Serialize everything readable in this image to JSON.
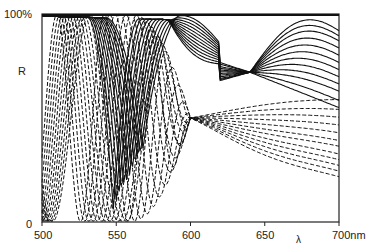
{
  "chart_data": {
    "type": "line",
    "title": "",
    "xlabel": "λ",
    "ylabel": "R",
    "xlim": [
      500,
      700
    ],
    "ylim": [
      0,
      100
    ],
    "x_ticks": [
      500,
      550,
      600,
      650,
      700
    ],
    "x_tick_labels": [
      "500",
      "550",
      "600",
      "650",
      "700nm"
    ],
    "y_tick_labels": [
      "0",
      "100%"
    ],
    "grid": false,
    "legend": null,
    "annotations": [
      {
        "text": "solid curves cross near",
        "x": 640,
        "y": 72
      },
      {
        "text": "dashed/solid curves converge near",
        "x": 600,
        "y": 50
      }
    ],
    "series_groups": [
      {
        "name": "solid",
        "style": "solid",
        "count": 12,
        "description": "High-reflectance curves near 100% at short wavelengths, with minima shifting from ~555nm to ~700nm; all pass through ~72% at ~640nm",
        "end_values_at_700": [
          87,
          85,
          83,
          80,
          77,
          74,
          71,
          68,
          65,
          62,
          58,
          55
        ]
      },
      {
        "name": "dashed",
        "style": "dashed",
        "count": 12,
        "description": "Oscillating curves with deep minima (near 0%) between 520–580nm, converging through ~50% at ~600nm, then broad maxima ~45–55% and falling to 25–54% at 700nm",
        "end_values_at_700": [
          54,
          50,
          47,
          44,
          41,
          38,
          36,
          33,
          31,
          29,
          27,
          25
        ]
      }
    ]
  },
  "labels": {
    "y_top": "100%",
    "y_zero": "0",
    "y_axis": "R",
    "x_axis": "λ",
    "x_ticks": [
      "500",
      "550",
      "600",
      "650",
      "700nm"
    ]
  }
}
